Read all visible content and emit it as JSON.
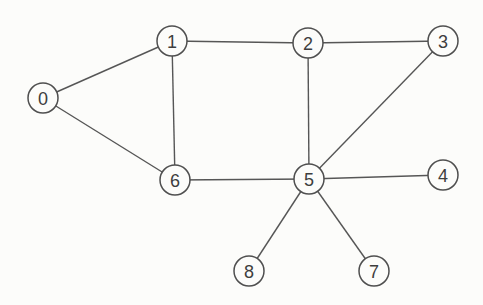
{
  "figure": {
    "background_color": "#fcfcfa",
    "edge_color": "#565656",
    "node_stroke_color": "#4f4f4f",
    "node_fill_color": "#fcfcfa",
    "label_color": "#3e3e3e",
    "node_radius": 15,
    "nodes": [
      {
        "id": "0",
        "label": "0",
        "x": 43,
        "y": 98
      },
      {
        "id": "1",
        "label": "1",
        "x": 172,
        "y": 41
      },
      {
        "id": "2",
        "label": "2",
        "x": 308,
        "y": 43
      },
      {
        "id": "3",
        "label": "3",
        "x": 443,
        "y": 41
      },
      {
        "id": "4",
        "label": "4",
        "x": 443,
        "y": 175
      },
      {
        "id": "5",
        "label": "5",
        "x": 309,
        "y": 179
      },
      {
        "id": "6",
        "label": "6",
        "x": 175,
        "y": 180
      },
      {
        "id": "7",
        "label": "7",
        "x": 374,
        "y": 271
      },
      {
        "id": "8",
        "label": "8",
        "x": 249,
        "y": 271
      }
    ],
    "edges": [
      [
        "0",
        "1"
      ],
      [
        "0",
        "6"
      ],
      [
        "1",
        "2"
      ],
      [
        "1",
        "6"
      ],
      [
        "2",
        "3"
      ],
      [
        "2",
        "5"
      ],
      [
        "3",
        "5"
      ],
      [
        "5",
        "6"
      ],
      [
        "4",
        "5"
      ],
      [
        "5",
        "7"
      ],
      [
        "5",
        "8"
      ]
    ]
  }
}
